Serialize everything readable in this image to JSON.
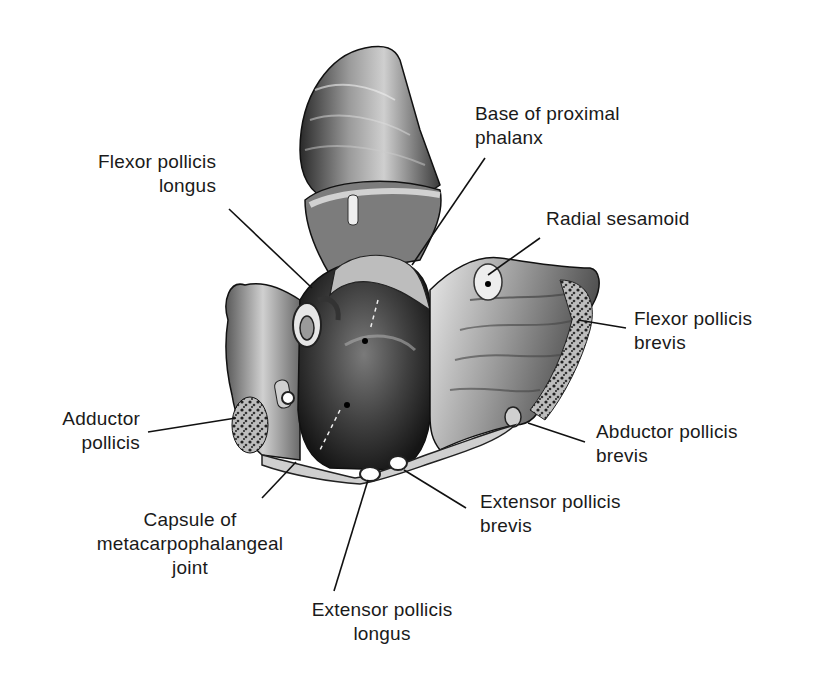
{
  "figure": {
    "labels": [
      {
        "id": "flexor-pollicis-longus",
        "lines": [
          "Flexor pollicis",
          "longus"
        ]
      },
      {
        "id": "base-of-proximal-phalanx",
        "lines": [
          "Base of proximal",
          "phalanx"
        ]
      },
      {
        "id": "radial-sesamoid",
        "lines": [
          "Radial sesamoid"
        ]
      },
      {
        "id": "flexor-pollicis-brevis",
        "lines": [
          "Flexor pollicis",
          "brevis"
        ]
      },
      {
        "id": "abductor-pollicis-brevis",
        "lines": [
          "Abductor pollicis",
          "brevis"
        ]
      },
      {
        "id": "adductor-pollicis",
        "lines": [
          "Adductor",
          "pollicis"
        ]
      },
      {
        "id": "capsule-of-mcp-joint",
        "lines": [
          "Capsule of",
          "metacarpophalangeal",
          "joint"
        ]
      },
      {
        "id": "extensor-pollicis-brevis",
        "lines": [
          "Extensor pollicis",
          "brevis"
        ]
      },
      {
        "id": "extensor-pollicis-longus",
        "lines": [
          "Extensor pollicis",
          "longus"
        ]
      }
    ],
    "colors": {
      "ink": "#1a1a1a",
      "tissue_light": "#d9d9d9",
      "tissue_mid": "#8a8a8a",
      "tissue_dark": "#2e2e2e",
      "background": "#ffffff"
    }
  }
}
